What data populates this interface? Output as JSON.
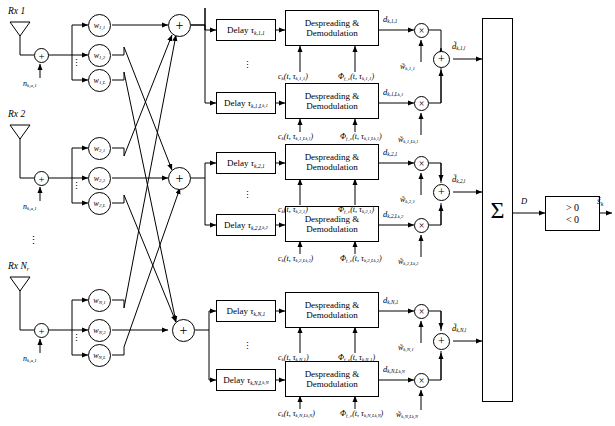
{
  "antennas": [
    {
      "label": "Rx",
      "index": "1",
      "noise": "n",
      "noise_sub": "k,a,1"
    },
    {
      "label": "Rx",
      "index": "2",
      "noise": "n",
      "noise_sub": "k,a,1"
    },
    {
      "label": "Rx",
      "index": "N",
      "index_sub": "r",
      "noise": "n",
      "noise_sub": "k,a,1"
    }
  ],
  "weights": {
    "symbol": "w",
    "rows": [
      [
        "1,1",
        "1,2",
        "1,L"
      ],
      [
        "2,1",
        "2,2",
        "2,L"
      ],
      [
        "N,1",
        "N,2",
        "N,L"
      ]
    ]
  },
  "branches": [
    {
      "delay_top": {
        "text": "Delay",
        "symbol": "τ",
        "sub": "k,1,1"
      },
      "delay_bot": {
        "text": "Delay",
        "symbol": "τ",
        "sub": "k,1,L",
        "sub2": "k,1"
      },
      "block": {
        "line1": "Despreading &",
        "line2": "Demodulation"
      },
      "code_top": {
        "c": "c",
        "c_sub": "k",
        "args": "(t, τ",
        "args_sub": "k,1,1",
        "close": ")"
      },
      "phase_top": {
        "phi": "Φ",
        "phi_sub": "f_c",
        "args": "(t, τ",
        "args_sub": "k,1,1",
        "close": ")"
      },
      "code_bot": {
        "c": "c",
        "c_sub": "k",
        "args": "(t, τ",
        "args_sub": "k,1,L",
        "args_sub2": "k,1",
        "close": ")"
      },
      "phase_bot": {
        "phi": "Φ",
        "phi_sub": "f_c",
        "args": "(t, τ",
        "args_sub": "k,1,L",
        "args_sub2": "k,1",
        "close": ")"
      },
      "d_top": {
        "symbol": "d",
        "sub": "k,1,1"
      },
      "d_bot": {
        "symbol": "d",
        "sub": "k,1,L",
        "sub2": "k,1"
      },
      "wt_top": {
        "symbol": "w̃",
        "sub": "k,1,1"
      },
      "wt_bot": {
        "symbol": "w̃",
        "sub": "k,1,L",
        "sub2": "k,1"
      },
      "out": {
        "symbol": "d̃",
        "sub": "k,1,l"
      }
    },
    {
      "delay_top": {
        "text": "Delay",
        "symbol": "τ",
        "sub": "k,2,1"
      },
      "delay_bot": {
        "text": "Delay",
        "symbol": "τ",
        "sub": "k,2,L",
        "sub2": "k,2"
      },
      "block": {
        "line1": "Despreading &",
        "line2": "Demodulation"
      },
      "code_top": {
        "c": "c",
        "c_sub": "k",
        "args": "(t, τ",
        "args_sub": "k,2,1",
        "close": ")"
      },
      "phase_top": {
        "phi": "Φ",
        "phi_sub": "f_c",
        "args": "(t, τ",
        "args_sub": "k,2,1",
        "close": ")"
      },
      "code_bot": {
        "c": "c",
        "c_sub": "k",
        "args": "(t, τ",
        "args_sub": "k,2,L",
        "args_sub2": "k,2",
        "close": ")"
      },
      "phase_bot": {
        "phi": "Φ",
        "phi_sub": "f_c",
        "args": "(t, τ",
        "args_sub": "k,2,L",
        "args_sub2": "k,2",
        "close": ")"
      },
      "d_top": {
        "symbol": "d",
        "sub": "k,2,1"
      },
      "d_bot": {
        "symbol": "d",
        "sub": "k,2,L",
        "sub2": "k,2"
      },
      "wt_top": {
        "symbol": "w̃",
        "sub": "k,2,1"
      },
      "wt_bot": {
        "symbol": "w̃",
        "sub": "k,2,L",
        "sub2": "k,2"
      },
      "out": {
        "symbol": "d̃",
        "sub": "k,2,l"
      }
    },
    {
      "delay_top": {
        "text": "Delay",
        "symbol": "τ",
        "sub": "k,N,1"
      },
      "delay_bot": {
        "text": "Delay",
        "symbol": "τ",
        "sub": "k,N,L",
        "sub2": "k,N"
      },
      "block": {
        "line1": "Despreading &",
        "line2": "Demodulation"
      },
      "code_top": {
        "c": "c",
        "c_sub": "k",
        "args": "(t, τ",
        "args_sub": "k,N,1",
        "close": ")"
      },
      "phase_top": {
        "phi": "Φ",
        "phi_sub": "f_c",
        "args": "(t, τ",
        "args_sub": "k,N,1",
        "close": ")"
      },
      "code_bot": {
        "c": "c",
        "c_sub": "k",
        "args": "(t, τ",
        "args_sub": "k,N,L",
        "args_sub2": "k,N",
        "close": ")"
      },
      "phase_bot": {
        "phi": "Φ",
        "phi_sub": "f_c",
        "args": "(t, τ",
        "args_sub": "k,N,L",
        "args_sub2": "k,N",
        "close": ")"
      },
      "d_top": {
        "symbol": "d",
        "sub": "k,N,1"
      },
      "d_bot": {
        "symbol": "d",
        "sub": "k,N,L",
        "sub2": "k,N"
      },
      "wt_top": {
        "symbol": "w̃",
        "sub": "k,N,1"
      },
      "wt_bot": {
        "symbol": "w̃",
        "sub": "k,N,L",
        "sub2": "k,N"
      },
      "out": {
        "symbol": "d̃",
        "sub": "k,N,l"
      }
    }
  ],
  "combiner": {
    "symbol": "Σ"
  },
  "decision_signal": {
    "symbol": "D"
  },
  "decision_block": {
    "line1": "> 0",
    "line2": "< 0"
  },
  "output": {
    "symbol": "ŝ",
    "sub": "k"
  },
  "glyphs": {
    "plus": "+",
    "times": "×",
    "vdots": "⋮"
  }
}
